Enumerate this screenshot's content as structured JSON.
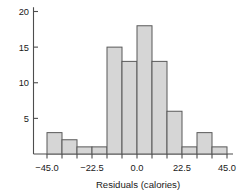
{
  "chart_data": {
    "type": "bar",
    "title": "",
    "subtitle": "",
    "xlabel": "Residuals (calories)",
    "ylabel": "",
    "categories": [
      "-45.0 to -37.5",
      "-37.5 to -30.0",
      "-30.0 to -22.5",
      "-22.5 to -15.0",
      "-15.0 to -7.5",
      "-7.5 to 0.0",
      "0.0 to 7.5",
      "7.5 to 15.0",
      "15.0 to 22.5",
      "22.5 to 30.0",
      "30.0 to 37.5",
      "37.5 to 45.0"
    ],
    "bin_edges": [
      -45.0,
      -37.5,
      -30.0,
      -22.5,
      -15.0,
      -7.5,
      0.0,
      7.5,
      15.0,
      22.5,
      30.0,
      37.5,
      45.0
    ],
    "bin_width": 7.5,
    "values": [
      3,
      2,
      1,
      1,
      15,
      13,
      18,
      13,
      6,
      1,
      3,
      1
    ],
    "xlim": [
      -48.0,
      48.0
    ],
    "ylim": [
      0,
      20.8
    ],
    "xticks": [
      -45.0,
      -22.5,
      0.0,
      22.5,
      45.0
    ],
    "xticklabels": [
      "−45.0",
      "−22.5",
      "0.0",
      "22.5",
      "45.0"
    ],
    "xminorticks": [
      -45.0,
      -37.5,
      -30.0,
      -22.5,
      -15.0,
      -7.5,
      0.0,
      7.5,
      15.0,
      22.5,
      30.0,
      37.5,
      45.0
    ],
    "yticks": [
      5,
      10,
      15,
      20
    ],
    "yticklabels": [
      "5",
      "10",
      "15",
      "20"
    ],
    "grid": false,
    "legend": null,
    "legend_position": "none",
    "colors": {
      "bar_fill": "#d6d6d6",
      "bar_stroke": "#595959",
      "axis": "#4d4d4d",
      "text": "#1a1a1a",
      "background": "#ffffff"
    }
  }
}
